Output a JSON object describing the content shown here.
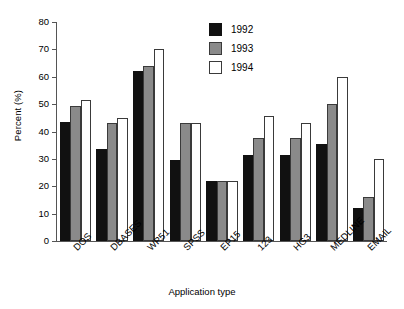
{
  "chart_data": {
    "type": "bar",
    "title": "",
    "subtitle": "",
    "xlabel": "Application type",
    "ylabel": "Percent (%)",
    "ylim": [
      0,
      80
    ],
    "yticks": [
      0,
      10,
      20,
      30,
      40,
      50,
      60,
      70,
      80
    ],
    "grid": false,
    "legend_position": "top-center",
    "categories": [
      "DOS",
      "DBASES",
      "WP51",
      "SPSS",
      "EP15",
      "123",
      "HG3",
      "MEDLINE",
      "EMAIL"
    ],
    "series": [
      {
        "name": "1992",
        "color": "#111111",
        "values": [
          43.5,
          33.5,
          62.0,
          29.5,
          22.0,
          31.5,
          31.5,
          35.5,
          12.0
        ]
      },
      {
        "name": "1993",
        "color": "#8a8a8a",
        "values": [
          49.5,
          43.0,
          64.0,
          43.0,
          22.0,
          37.5,
          37.5,
          50.0,
          16.0
        ]
      },
      {
        "name": "1994",
        "color": "#ffffff",
        "values": [
          51.5,
          45.0,
          70.0,
          43.0,
          22.0,
          45.5,
          43.0,
          60.0,
          30.0
        ]
      }
    ],
    "annotations": []
  },
  "legend": {
    "items": [
      {
        "label": "1992"
      },
      {
        "label": "1993"
      },
      {
        "label": "1994"
      }
    ]
  },
  "axes": {
    "y_tick_labels": [
      "80",
      "70",
      "60",
      "50",
      "40",
      "30",
      "20",
      "10",
      "0"
    ]
  }
}
